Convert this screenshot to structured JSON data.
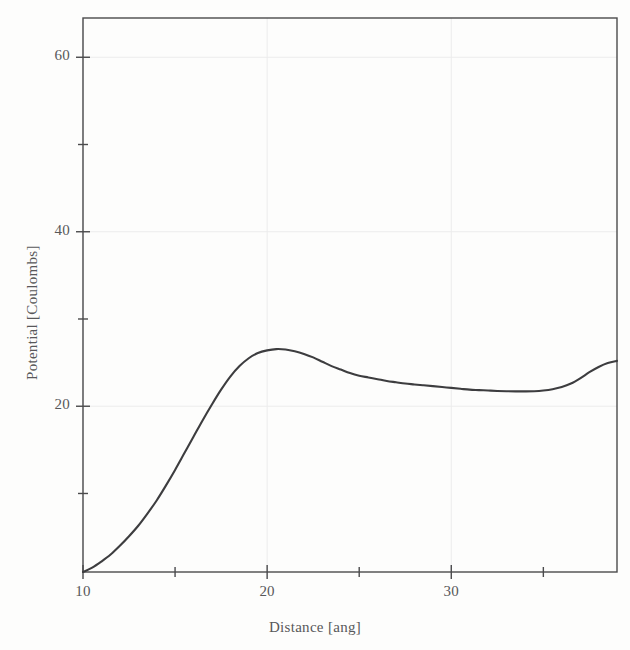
{
  "chart_data": {
    "type": "line",
    "title": "",
    "xlabel": "Distance [ang]",
    "ylabel": "Potential [Coulombs]",
    "xlim": [
      10,
      39
    ],
    "ylim": [
      1,
      64.5
    ],
    "grid": true,
    "legend": null,
    "x_ticks_major": [
      10,
      20,
      30
    ],
    "x_ticks_major_labels": [
      "10",
      "20",
      "30"
    ],
    "x_ticks_minor": [
      15,
      25,
      35
    ],
    "y_ticks_major": [
      20,
      40,
      60
    ],
    "y_ticks_major_labels": [
      "20",
      "40",
      "60"
    ],
    "y_ticks_minor": [
      10,
      30,
      50
    ],
    "series": [
      {
        "name": "potential",
        "color": "#3d3d3f",
        "x": [
          10.0,
          10.5,
          11.0,
          11.5,
          12.0,
          12.5,
          13.0,
          13.5,
          14.0,
          14.5,
          15.0,
          15.5,
          16.0,
          16.5,
          17.0,
          17.5,
          18.0,
          18.5,
          19.0,
          19.5,
          20.0,
          20.5,
          21.0,
          21.5,
          22.0,
          22.5,
          23.0,
          23.5,
          24.0,
          24.5,
          25.0,
          25.5,
          26.0,
          26.5,
          27.0,
          27.5,
          28.0,
          28.5,
          29.0,
          29.5,
          30.0,
          30.5,
          31.0,
          31.5,
          32.0,
          32.5,
          33.0,
          33.5,
          34.0,
          34.5,
          35.0,
          35.5,
          36.0,
          36.5,
          37.0,
          37.5,
          38.0,
          38.5,
          39.0
        ],
        "y": [
          1.0,
          1.5,
          2.2,
          3.0,
          4.0,
          5.1,
          6.3,
          7.7,
          9.2,
          10.9,
          12.7,
          14.6,
          16.5,
          18.4,
          20.2,
          21.9,
          23.4,
          24.6,
          25.5,
          26.1,
          26.4,
          26.55,
          26.5,
          26.3,
          26.0,
          25.6,
          25.1,
          24.6,
          24.2,
          23.8,
          23.5,
          23.3,
          23.1,
          22.9,
          22.75,
          22.6,
          22.5,
          22.4,
          22.3,
          22.2,
          22.1,
          22.0,
          21.9,
          21.85,
          21.8,
          21.75,
          21.72,
          21.7,
          21.7,
          21.72,
          21.8,
          21.95,
          22.2,
          22.6,
          23.2,
          23.9,
          24.5,
          24.95,
          25.2
        ]
      }
    ],
    "peak": {
      "x": 20.5,
      "y": 26.55
    },
    "minimum": {
      "x": 33.8,
      "y": 21.7
    }
  },
  "axes": {
    "frame_color": "#4a4a4c",
    "grid_color": "#ececec",
    "background": "#fdfdfc"
  }
}
